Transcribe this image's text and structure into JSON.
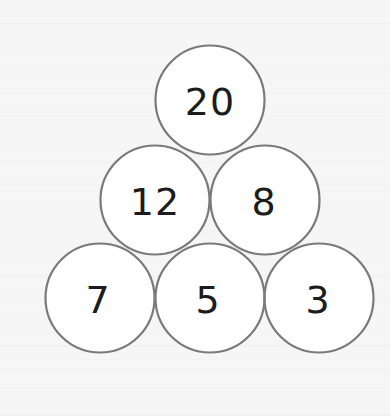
{
  "diagram": {
    "title": "",
    "type": "number-pyramid",
    "colors": {
      "background": "#f6f6f6",
      "circle_fill": "#ffffff",
      "circle_stroke": "#7a7a7a",
      "text": "#1c1c1c"
    },
    "radius": 54.5,
    "rows": [
      [
        {
          "value": "20",
          "cx": 210,
          "cy": 100
        }
      ],
      [
        {
          "value": "12",
          "cx": 155,
          "cy": 200
        },
        {
          "value": "8",
          "cx": 265,
          "cy": 200
        }
      ],
      [
        {
          "value": "7",
          "cx": 100,
          "cy": 298
        },
        {
          "value": "5",
          "cx": 210,
          "cy": 298
        },
        {
          "value": "3",
          "cx": 319,
          "cy": 298
        }
      ]
    ]
  }
}
